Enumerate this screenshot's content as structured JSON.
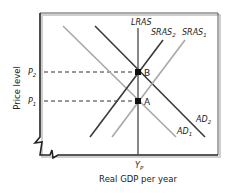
{
  "diagram": {
    "type": "AS-AD economic diagram",
    "x_axis_label": "Real GDP per year",
    "y_axis_label": "Price level",
    "x_tick": {
      "base": "Y",
      "sub": "P"
    },
    "y_ticks": [
      {
        "base": "P",
        "sub": "2"
      },
      {
        "base": "P",
        "sub": "1"
      }
    ],
    "curves": {
      "lras": "LRAS",
      "sras2": {
        "base": "SRAS",
        "sub": "2"
      },
      "sras1": {
        "base": "SRAS",
        "sub": "1"
      },
      "ad2": {
        "base": "AD",
        "sub": "2"
      },
      "ad1": {
        "base": "AD",
        "sub": "1"
      }
    },
    "points": [
      {
        "label": "B"
      },
      {
        "label": "A"
      }
    ],
    "colors": {
      "dark_curve": "#3a3a3a",
      "light_curve": "#a8a8a8",
      "axis": "#222222"
    }
  }
}
